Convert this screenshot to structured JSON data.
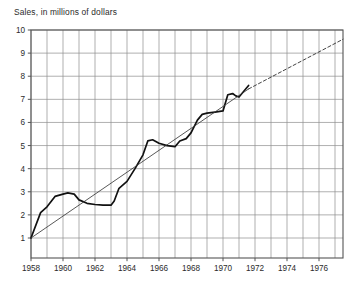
{
  "chart_data": {
    "type": "line",
    "title": "Sales, in millions of dollars",
    "xlabel": "",
    "ylabel": "Sales, in millions of dollars",
    "xlim": [
      1958,
      1977.5
    ],
    "ylim": [
      0.1,
      10
    ],
    "grid": true,
    "legend": "none",
    "ytick_labels": [
      "10",
      "9",
      "8",
      "7",
      "6",
      "5",
      "4",
      "3",
      "2",
      "1"
    ],
    "ytick_values": [
      10,
      9,
      8,
      7,
      6,
      5,
      4,
      3,
      2,
      1
    ],
    "xtick_labels": [
      "1958",
      "1960",
      "1962",
      "1964",
      "1966",
      "1968",
      "1970",
      "1972",
      "1974",
      "1976"
    ],
    "xtick_values": [
      1958,
      1960,
      1962,
      1964,
      1966,
      1968,
      1970,
      1972,
      1974,
      1976
    ],
    "x_minor_step": 1,
    "series": [
      {
        "name": "Sales",
        "style": "solid-thick",
        "color": "#111111",
        "x": [
          1958.0,
          1958.6,
          1959.0,
          1959.5,
          1960.0,
          1960.3,
          1960.7,
          1961.0,
          1961.5,
          1962.0,
          1962.5,
          1963.0,
          1963.2,
          1963.5,
          1964.0,
          1964.5,
          1965.0,
          1965.3,
          1965.6,
          1966.0,
          1966.5,
          1967.0,
          1967.3,
          1967.7,
          1968.0,
          1968.4,
          1968.7,
          1969.0,
          1969.5,
          1970.0,
          1970.3,
          1970.6,
          1970.8,
          1971.0,
          1971.3,
          1971.6
        ],
        "y": [
          1.0,
          2.1,
          2.35,
          2.8,
          2.9,
          2.95,
          2.9,
          2.65,
          2.5,
          2.45,
          2.42,
          2.42,
          2.6,
          3.15,
          3.45,
          4.0,
          4.6,
          5.2,
          5.25,
          5.1,
          5.0,
          4.95,
          5.2,
          5.3,
          5.55,
          6.1,
          6.35,
          6.4,
          6.45,
          6.5,
          7.2,
          7.25,
          7.15,
          7.1,
          7.35,
          7.6
        ]
      },
      {
        "name": "Trend (fitted)",
        "style": "solid-thin",
        "color": "#3a3a3a",
        "x": [
          1958.0,
          1971.6
        ],
        "y": [
          1.0,
          7.45
        ]
      },
      {
        "name": "Trend (projected)",
        "style": "dashed-thin",
        "color": "#3a3a3a",
        "x": [
          1971.6,
          1977.5
        ],
        "y": [
          7.45,
          9.6
        ]
      }
    ]
  }
}
